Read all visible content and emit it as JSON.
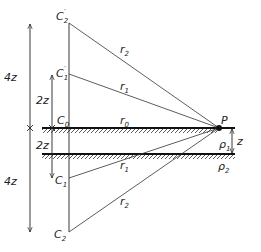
{
  "diagram": {
    "points": {
      "c2_prime": {
        "label": "C",
        "sub": "2",
        "sup": "′"
      },
      "c1_prime": {
        "label": "C",
        "sub": "1",
        "sup": "′"
      },
      "c0": {
        "label": "C",
        "sub": "0"
      },
      "c1": {
        "label": "C",
        "sub": "1"
      },
      "c2": {
        "label": "C",
        "sub": "2"
      },
      "p": {
        "label": "P"
      }
    },
    "distances": {
      "r0": {
        "label": "r",
        "sub": "0"
      },
      "r1_upper": {
        "label": "r",
        "sub": "1"
      },
      "r2_upper": {
        "label": "r",
        "sub": "2"
      },
      "r1_lower": {
        "label": "r",
        "sub": "1"
      },
      "r2_lower": {
        "label": "r",
        "sub": "2"
      }
    },
    "dimensions": {
      "upper_4z": "4z",
      "upper_2z": "2z",
      "lower_2z": "2z",
      "lower_4z": "4z",
      "layer_z": "z"
    },
    "resistivities": {
      "rho1": {
        "label": "ρ",
        "sub": "1"
      },
      "rho2": {
        "label": "ρ",
        "sub": "2"
      }
    },
    "colors": {
      "line": "#222222",
      "background": "#ffffff"
    }
  }
}
